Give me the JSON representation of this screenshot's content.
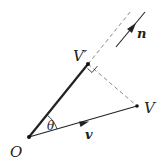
{
  "diagram": {
    "points": {
      "O": {
        "label": "O",
        "x": 29,
        "y": 137
      },
      "V_prime": {
        "label": "V′",
        "x": 88,
        "y": 64
      },
      "V": {
        "label": "V",
        "x": 137,
        "y": 106
      }
    },
    "labels": {
      "origin": "O",
      "v_prime": "V′",
      "v_point": "V",
      "angle": "θ",
      "vector_v": "v",
      "vector_n": "n"
    },
    "colors": {
      "stroke": "#222222",
      "dashed": "#888888",
      "background": "#ffffff"
    }
  }
}
